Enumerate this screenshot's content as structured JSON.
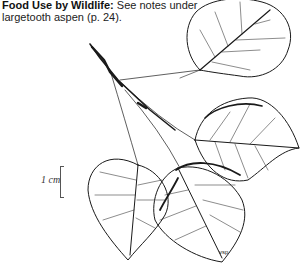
{
  "caption": {
    "heading": "Food Use by Wildlife:",
    "line1_rest": " See notes under",
    "line2": "largetooth aspen (p. 24)."
  },
  "scale": {
    "label": "1 cm"
  },
  "illustration": {
    "subject": "aspen-branch-with-leaves",
    "signature": "vsp",
    "ink_color": "#1a1a1a"
  }
}
